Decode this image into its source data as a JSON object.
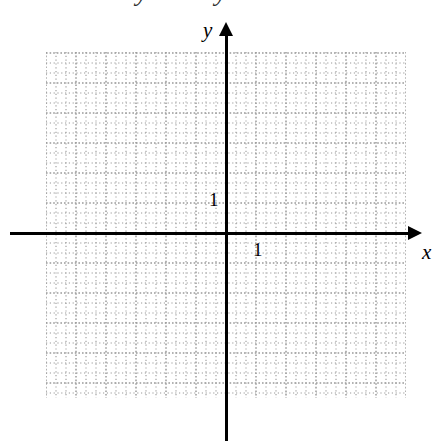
{
  "figure": {
    "width": 442,
    "height": 445,
    "background_color": "#ffffff"
  },
  "chart_data": {
    "type": "scatter",
    "title": "",
    "subtitle": "",
    "xlabel": "x",
    "ylabel": "y",
    "series": [],
    "x": [],
    "values": [],
    "annotations": [],
    "grid": true,
    "grid_style": "dotted",
    "grid_color": "#9a9a9a",
    "minor_grid": true,
    "minor_divisions_per_unit": 3,
    "legend": "none",
    "axis_color": "#000000",
    "unit_pixels": 30,
    "origin_px": {
      "x": 226,
      "y": 233
    },
    "xlim": [
      -6,
      6
    ],
    "ylim": [
      -5.5,
      6
    ],
    "xticks": [
      1
    ],
    "yticks": [
      1
    ],
    "xticklabels": [
      "1"
    ],
    "yticklabels": [
      "1"
    ],
    "x_axis_arrow": "right",
    "y_axis_arrow": "up"
  },
  "axes": {
    "x_label": "x",
    "y_label": "y",
    "x_tick_label": "1",
    "y_tick_label": "1"
  },
  "artifacts": {
    "top_clipped_glyph_left": "y",
    "top_clipped_glyph_right": "y"
  }
}
